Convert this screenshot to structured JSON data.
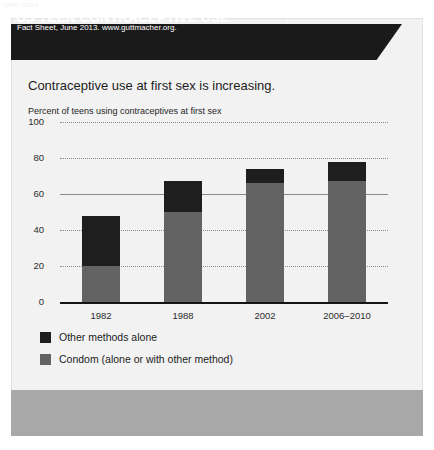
{
  "watermark": "Unit Care",
  "banner": {
    "title": "US TEEN CONTRACEPTIVE USE"
  },
  "headline": "Contraceptive use at first sex is increasing.",
  "footer": {
    "text": "Taken from: Guttmacher Institute, \"Facts on American Teens' Sexual and Reproductive Health,\" In Brief: Fact Sheet, June 2013. www.guttmacher.org."
  },
  "colors": {
    "banner_bg": "#1a1a1a",
    "card_bg": "#f2f2f2",
    "footer_bg": "#a8a8a8",
    "series_condom": "#636363",
    "series_other": "#1e1e1e"
  },
  "chart_data": {
    "type": "bar",
    "stacked": true,
    "title": "US TEEN CONTRACEPTIVE USE",
    "subtitle": "Contraceptive use at first sex is increasing.",
    "ylabel": "Percent of teens using contraceptives at first sex",
    "xlabel": "",
    "categories": [
      "1982",
      "1988",
      "2002",
      "2006–2010"
    ],
    "ylim": [
      0,
      100
    ],
    "yticks": [
      0,
      20,
      40,
      60,
      80,
      100
    ],
    "grid": true,
    "legend_position": "bottom-left",
    "series": [
      {
        "name": "Condom (alone or with other method)",
        "color": "#636363",
        "values": [
          20,
          50,
          66,
          67
        ]
      },
      {
        "name": "Other methods alone",
        "color": "#1e1e1e",
        "values": [
          28,
          17,
          8,
          11
        ]
      }
    ],
    "totals": [
      48,
      67,
      74,
      78
    ]
  }
}
